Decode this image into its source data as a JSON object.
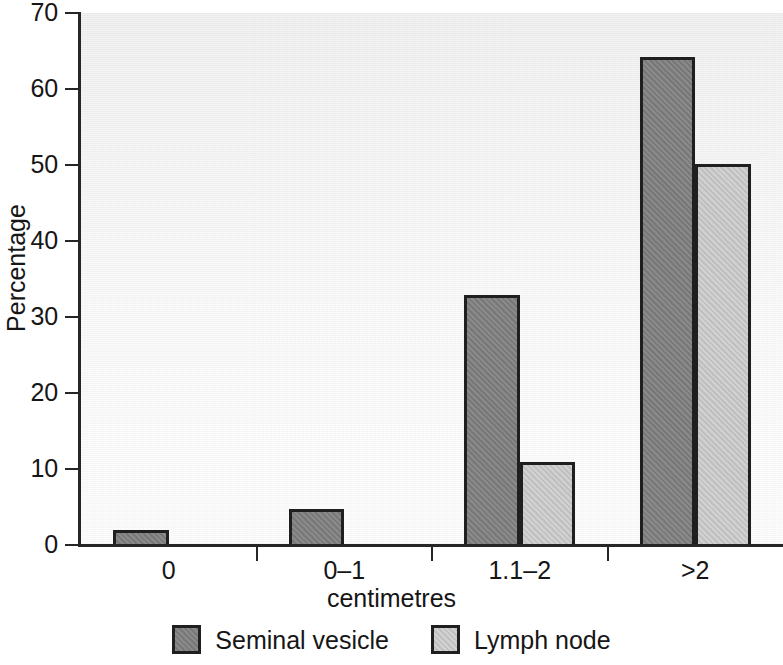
{
  "chart_data": {
    "type": "bar",
    "title": "",
    "subtitle": "",
    "xlabel": "centimetres",
    "ylabel": "Percentage",
    "categories": [
      "0",
      "0–1",
      "1.1–2",
      ">2"
    ],
    "series": [
      {
        "name": "Seminal vesicle",
        "color": "#7f7e7f",
        "values": [
          2.2,
          5.0,
          33.1,
          64.5
        ]
      },
      {
        "name": "Lymph node",
        "color": "#c9c8c8",
        "values": [
          0,
          0,
          11.2,
          50.4
        ]
      }
    ],
    "ylim": [
      0,
      70
    ],
    "ytick_values": [
      0,
      10,
      20,
      30,
      40,
      50,
      60,
      70
    ],
    "ytick_labels": [
      "0",
      "10",
      "20",
      "30",
      "40",
      "50",
      "60",
      "70"
    ],
    "grid": false,
    "legend_position": "bottom",
    "bar_style": "grouped-adjacent",
    "plot_background": "#f7f7f7",
    "axis_color": "#262626"
  },
  "legend": {
    "entries": [
      {
        "label": "Seminal vesicle",
        "swatch": "dark-gray-swatch"
      },
      {
        "label": "Lymph node",
        "swatch": "light-gray-swatch"
      }
    ]
  }
}
